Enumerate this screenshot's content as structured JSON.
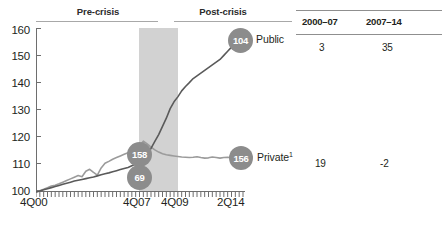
{
  "periods": {
    "pre": "Pre-crisis",
    "post": "Post-crisis"
  },
  "axis": {
    "y_ticks": [
      "160",
      "150",
      "140",
      "130",
      "120",
      "110",
      "100"
    ],
    "x_ticks": [
      "4Q00",
      "4Q07",
      "4Q09",
      "2Q14"
    ]
  },
  "bubbles": {
    "public_end": "104",
    "private_end": "156",
    "mid_upper": "158",
    "mid_lower": "69"
  },
  "series_labels": {
    "public": "Public",
    "private": "Private",
    "private_footnote": "1"
  },
  "table": {
    "headers": [
      "2000–07",
      "2007–14"
    ],
    "rows": [
      {
        "values": [
          "3",
          "35"
        ]
      },
      {
        "values": [
          "19",
          "-2"
        ]
      }
    ]
  },
  "colors": {
    "public_line": "#5a5a5a",
    "private_line": "#9b9b9b",
    "bubble": "#8c8c8c",
    "shaded_band": "#d2d2d2",
    "axis": "#6e6e6e",
    "rule": "#8f8f8f"
  },
  "chart_data": {
    "type": "line",
    "title": "",
    "subtitle": "",
    "xlabel": "",
    "ylabel": "",
    "ylim": [
      100,
      160
    ],
    "xlim": [
      "4Q00",
      "2Q14"
    ],
    "grid": false,
    "legend": "inline-end-labels",
    "annotations": [
      {
        "text": "Pre-crisis",
        "span": [
          "4Q00",
          "4Q07"
        ]
      },
      {
        "text": "Post-crisis",
        "span": [
          "4Q09",
          "2Q14"
        ]
      },
      {
        "text": "shaded recession band",
        "span": [
          "4Q07",
          "4Q09"
        ]
      },
      {
        "text": "104",
        "series": "Public",
        "at": "2Q14"
      },
      {
        "text": "156",
        "series": "Private",
        "at": "2Q14"
      },
      {
        "text": "158",
        "series": "Public",
        "at": "4Q07"
      },
      {
        "text": "69",
        "series": "Private",
        "at": "4Q07"
      }
    ],
    "x": [
      "4Q00",
      "1Q01",
      "2Q01",
      "3Q01",
      "4Q01",
      "1Q02",
      "2Q02",
      "3Q02",
      "4Q02",
      "1Q03",
      "2Q03",
      "3Q03",
      "4Q03",
      "1Q04",
      "2Q04",
      "3Q04",
      "4Q04",
      "1Q05",
      "2Q05",
      "3Q05",
      "4Q05",
      "1Q06",
      "2Q06",
      "3Q06",
      "4Q06",
      "1Q07",
      "2Q07",
      "3Q07",
      "4Q07",
      "1Q08",
      "2Q08",
      "3Q08",
      "4Q08",
      "1Q09",
      "2Q09",
      "3Q09",
      "4Q09",
      "1Q10",
      "2Q10",
      "3Q10",
      "4Q10",
      "1Q11",
      "2Q11",
      "3Q11",
      "4Q11",
      "1Q12",
      "2Q12",
      "3Q12",
      "4Q12",
      "1Q13",
      "2Q13",
      "3Q13",
      "4Q13",
      "1Q14",
      "2Q14"
    ],
    "series": [
      {
        "name": "Public",
        "color": "#5a5a5a",
        "values": [
          100,
          100.4,
          100.8,
          101.2,
          101.6,
          102,
          102.4,
          102.8,
          103.2,
          103.6,
          104,
          104.3,
          104.6,
          104.9,
          105.2,
          105.5,
          105.9,
          106.3,
          106.7,
          107,
          107.4,
          107.8,
          108.2,
          108.6,
          109,
          109.6,
          110.2,
          110.8,
          111.5,
          113.5,
          116,
          118.5,
          121,
          124,
          127,
          130.5,
          133,
          134.8,
          137,
          138.6,
          140,
          141.5,
          142.5,
          143.5,
          144.5,
          145.5,
          146.5,
          147.5,
          148.5,
          150,
          151.5,
          153,
          154.5,
          156,
          157.5
        ]
      },
      {
        "name": "Private",
        "color": "#9b9b9b",
        "values": [
          100,
          100.5,
          101,
          101.6,
          102.2,
          102.5,
          103,
          103.6,
          104.2,
          104.8,
          105.4,
          106,
          105.6,
          107.6,
          108.3,
          107.2,
          106.2,
          108.8,
          110.5,
          111.2,
          112,
          112.6,
          113.2,
          113.8,
          114.4,
          115,
          115.6,
          116.8,
          118.6,
          117.6,
          116.4,
          115.4,
          114.6,
          114,
          113.6,
          113.4,
          113.2,
          113,
          112.8,
          112.7,
          112.6,
          112.7,
          112.9,
          112.6,
          112.4,
          112.5,
          112.8,
          112.6,
          112.4,
          112.6,
          112.7,
          112.5,
          112.4,
          112.7,
          112.9
        ]
      }
    ]
  }
}
